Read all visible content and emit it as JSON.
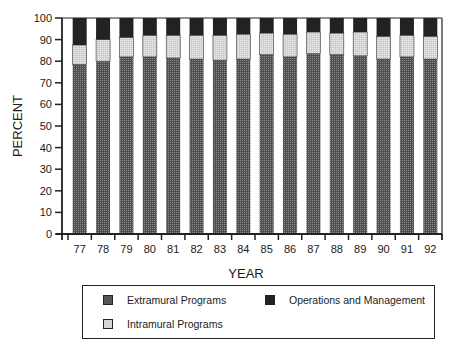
{
  "chart_data": {
    "type": "bar",
    "stacked": true,
    "title": "",
    "xlabel": "YEAR",
    "ylabel": "PERCENT",
    "ylim": [
      0,
      100
    ],
    "yticks": [
      0,
      10,
      20,
      30,
      40,
      50,
      60,
      70,
      80,
      90,
      100
    ],
    "grid": false,
    "legend_position": "bottom",
    "categories": [
      "77",
      "78",
      "79",
      "80",
      "81",
      "82",
      "83",
      "84",
      "85",
      "86",
      "87",
      "88",
      "89",
      "90",
      "91",
      "92"
    ],
    "series": [
      {
        "name": "Extramural Programs",
        "color": "#555555",
        "values": [
          78.5,
          80,
          82,
          82,
          81.5,
          81,
          80.5,
          81,
          83,
          82,
          83.5,
          83,
          82.5,
          81,
          82,
          81
        ]
      },
      {
        "name": "Intramural Programs",
        "color": "#d4d4d4",
        "values": [
          9,
          10,
          9,
          10,
          10.5,
          11,
          11.5,
          11.5,
          10,
          10.5,
          10,
          10,
          11,
          10.5,
          10,
          10.5
        ]
      },
      {
        "name": "Operations and Management",
        "color": "#222222",
        "values": [
          12.5,
          10,
          9,
          8,
          8,
          8,
          8,
          7.5,
          7,
          7.5,
          6.5,
          7,
          6.5,
          8.5,
          8,
          8.5
        ]
      }
    ]
  },
  "legend": {
    "items": [
      {
        "label": "Extramural Programs"
      },
      {
        "label": "Operations and Management"
      },
      {
        "label": "Intramural Programs"
      }
    ]
  }
}
